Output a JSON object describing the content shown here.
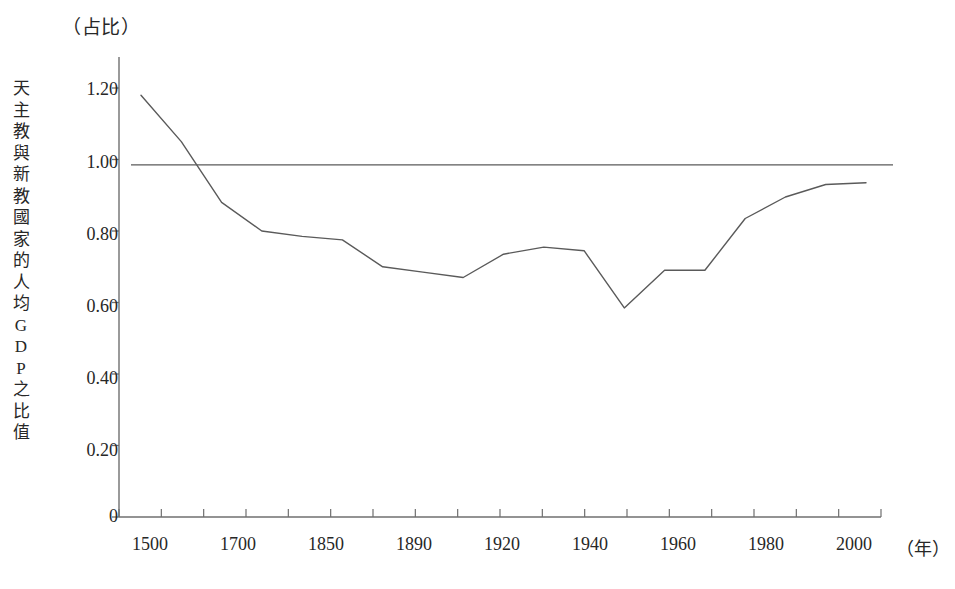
{
  "chart_data": {
    "type": "line",
    "title": "",
    "unit_caption": "（占比）",
    "ylabel": "天主教與新教國家的人均GDP之比值",
    "ylabel_chars": [
      "天",
      "主",
      "教",
      "與",
      "新",
      "教",
      "國",
      "家",
      "的",
      "人",
      "均",
      "G",
      "D",
      "P",
      "之",
      "比",
      "值"
    ],
    "xlabel": "（年）",
    "ylim": [
      0,
      1.3
    ],
    "yticks": [
      0,
      0.2,
      0.4,
      0.6,
      0.8,
      1.0,
      1.2
    ],
    "ytick_labels": [
      "0",
      "0.20",
      "0.40",
      "0.60",
      "0.80",
      "1.00",
      "1.20"
    ],
    "xtick_labels": [
      "1500",
      "1700",
      "1850",
      "1890",
      "1920",
      "1940",
      "1960",
      "1980",
      "2000"
    ],
    "x": [
      1500,
      1600,
      1700,
      1750,
      1800,
      1850,
      1870,
      1890,
      1900,
      1913,
      1920,
      1929,
      1940,
      1950,
      1960,
      1970,
      1980,
      1990,
      2000
    ],
    "values": [
      1.18,
      1.05,
      0.88,
      0.8,
      0.785,
      0.775,
      0.7,
      0.685,
      0.67,
      0.735,
      0.755,
      0.745,
      0.585,
      0.69,
      0.69,
      0.835,
      0.895,
      0.93,
      0.935
    ],
    "reference_line": {
      "label": "1.00 parity line",
      "value": 0.985
    },
    "grid": false,
    "legend": "none",
    "line_color": "#5a5a5a",
    "axis_color": "#6f6f6f"
  }
}
